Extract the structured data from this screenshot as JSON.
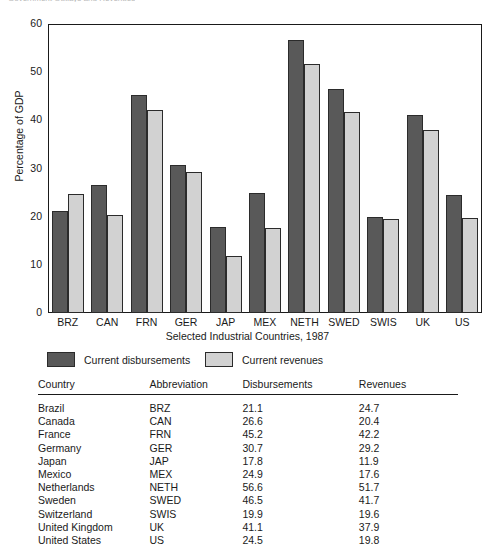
{
  "top_caption": "Government Outlays and Revenues",
  "chart_data": {
    "type": "bar",
    "title": "",
    "xlabel": "Selected Industrial Countries, 1987",
    "ylabel": "Percentage of GDP",
    "ylim": [
      0,
      60
    ],
    "yticks": [
      0,
      10,
      20,
      30,
      40,
      50,
      60
    ],
    "grid": false,
    "legend_position": "below",
    "categories": [
      "BRZ",
      "CAN",
      "FRN",
      "GER",
      "JAP",
      "MEX",
      "NETH",
      "SWED",
      "SWIS",
      "UK",
      "US"
    ],
    "series": [
      {
        "name": "Current disbursements",
        "color": "#595959",
        "values": [
          21.1,
          26.6,
          45.2,
          30.7,
          17.8,
          24.9,
          56.6,
          46.5,
          19.9,
          41.1,
          24.5
        ]
      },
      {
        "name": "Current revenues",
        "color": "#d2d2d2",
        "values": [
          24.7,
          20.4,
          42.2,
          29.2,
          11.9,
          17.6,
          51.7,
          41.7,
          19.6,
          37.9,
          19.8
        ]
      }
    ]
  },
  "legend": [
    {
      "label": "Current disbursements",
      "swatch": "dark"
    },
    {
      "label": "Current revenues",
      "swatch": "light"
    }
  ],
  "table": {
    "headers": [
      "Country",
      "Abbreviation",
      "Disbursements",
      "Revenues"
    ],
    "rows": [
      [
        "Brazil",
        "BRZ",
        "21.1",
        "24.7"
      ],
      [
        "Canada",
        "CAN",
        "26.6",
        "20.4"
      ],
      [
        "France",
        "FRN",
        "45.2",
        "42.2"
      ],
      [
        "Germany",
        "GER",
        "30.7",
        "29.2"
      ],
      [
        "Japan",
        "JAP",
        "17.8",
        "11.9"
      ],
      [
        "Mexico",
        "MEX",
        "24.9",
        "17.6"
      ],
      [
        "Netherlands",
        "NETH",
        "56.6",
        "51.7"
      ],
      [
        "Sweden",
        "SWED",
        "46.5",
        "41.7"
      ],
      [
        "Switzerland",
        "SWIS",
        "19.9",
        "19.6"
      ],
      [
        "United Kingdom",
        "UK",
        "41.1",
        "37.9"
      ],
      [
        "United States",
        "US",
        "24.5",
        "19.8"
      ]
    ]
  }
}
